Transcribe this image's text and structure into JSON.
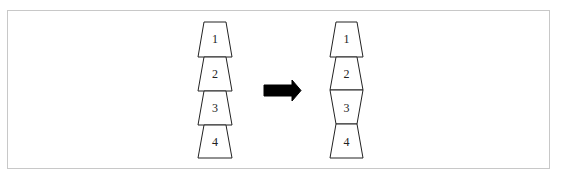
{
  "diagram": {
    "left_stack": {
      "blocks": [
        {
          "label": "1",
          "orientation": "narrow-top"
        },
        {
          "label": "2",
          "orientation": "narrow-top"
        },
        {
          "label": "3",
          "orientation": "narrow-top"
        },
        {
          "label": "4",
          "orientation": "narrow-top"
        }
      ]
    },
    "arrow": {
      "direction": "right",
      "color": "#000000"
    },
    "right_stack": {
      "blocks": [
        {
          "label": "1",
          "orientation": "narrow-top"
        },
        {
          "label": "2",
          "orientation": "narrow-top"
        },
        {
          "label": "3",
          "orientation": "narrow-bottom"
        },
        {
          "label": "4",
          "orientation": "narrow-top"
        }
      ]
    },
    "colors": {
      "stroke": "#222222",
      "fill": "#ffffff",
      "frame": "#c8c8c8"
    }
  }
}
